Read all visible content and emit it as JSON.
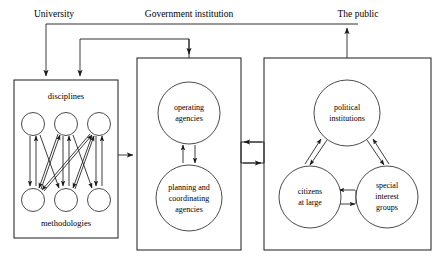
{
  "diagram": {
    "background_color": "#ffffff",
    "line_color": "#1a1a1a",
    "top_labels": [
      {
        "id": "university",
        "text": "University",
        "x": 54,
        "y": 14
      },
      {
        "id": "government-institution",
        "text": "Government institution",
        "x": 189,
        "y": 14
      },
      {
        "id": "the-public",
        "text": "The public",
        "x": 358,
        "y": 14
      }
    ],
    "boxes": [
      {
        "id": "university-box",
        "x": 14,
        "y": 80,
        "width": 104,
        "height": 158
      },
      {
        "id": "government-box",
        "x": 137,
        "y": 58,
        "width": 104,
        "height": 192
      },
      {
        "id": "public-box",
        "x": 264,
        "y": 58,
        "width": 167,
        "height": 192
      }
    ],
    "group_labels": [
      {
        "id": "disciplines",
        "text": "disciplines",
        "x": 66,
        "y": 97
      },
      {
        "id": "methodologies",
        "text": "methodologies",
        "x": 66,
        "y": 224
      }
    ],
    "university_nodes": {
      "disciplines": [
        {
          "id": "discipline-1",
          "cx": 33,
          "cy": 124,
          "r": 11.5
        },
        {
          "id": "discipline-2",
          "cx": 66,
          "cy": 124,
          "r": 11.5
        },
        {
          "id": "discipline-3",
          "cx": 99,
          "cy": 124,
          "r": 11.5
        }
      ],
      "methodologies": [
        {
          "id": "methodology-1",
          "cx": 33,
          "cy": 200,
          "r": 11.5
        },
        {
          "id": "methodology-2",
          "cx": 66,
          "cy": 200,
          "r": 11.5
        },
        {
          "id": "methodology-3",
          "cx": 99,
          "cy": 200,
          "r": 11.5
        }
      ]
    },
    "government_nodes": [
      {
        "id": "operating-agencies",
        "cx": 189,
        "cy": 113,
        "r": 31,
        "lines": [
          "operating",
          "agencies"
        ]
      },
      {
        "id": "planning-coordinating-agencies",
        "cx": 189,
        "cy": 198,
        "r": 33,
        "lines": [
          "planning and",
          "coordinating",
          "agencies"
        ]
      }
    ],
    "public_nodes": [
      {
        "id": "political-institutions",
        "cx": 347,
        "cy": 113,
        "r": 33,
        "lines": [
          "political",
          "institutions"
        ]
      },
      {
        "id": "citizens-at-large",
        "cx": 310,
        "cy": 197,
        "r": 31,
        "lines": [
          "citizens",
          "at large"
        ]
      },
      {
        "id": "special-interest-groups",
        "cx": 387,
        "cy": 197,
        "r": 31,
        "lines": [
          "special",
          "interest",
          "groups"
        ]
      }
    ],
    "connectors": [
      {
        "id": "university-to-government",
        "from": "university-box",
        "to": "government-box",
        "direction": "right"
      },
      {
        "id": "government-to-public-upper",
        "from": "public-box",
        "to": "government-box",
        "direction": "left"
      },
      {
        "id": "government-to-public-lower",
        "from": "government-box",
        "to": "public-box",
        "direction": "right"
      },
      {
        "id": "feedback-to-university",
        "from": "top-bus",
        "to": "university-box",
        "direction": "down"
      },
      {
        "id": "feedback-to-government",
        "from": "mid-bus",
        "to": "government-box",
        "direction": "down"
      },
      {
        "id": "government-to-public-label",
        "from": "government-box",
        "to": "the-public",
        "direction": "up"
      }
    ]
  }
}
